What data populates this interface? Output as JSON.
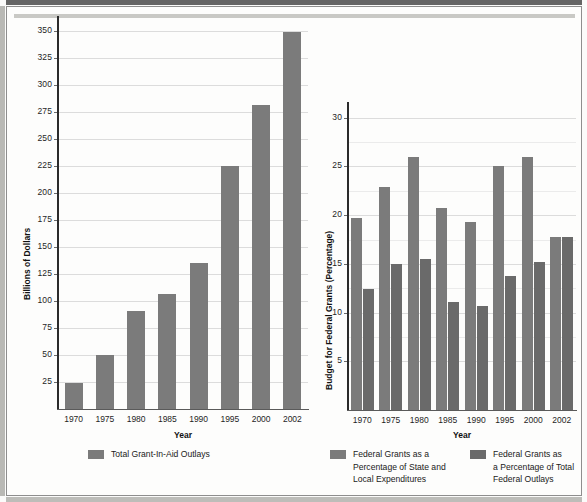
{
  "page": {
    "background_color": "#fdfdfc",
    "bar_color": "#7b7b7b",
    "bar_color_dark": "#6a6a6a"
  },
  "chart_data": [
    {
      "id": "left-chart",
      "type": "bar",
      "title": "",
      "xlabel": "Year",
      "ylabel": "Billions of Dollars",
      "categories": [
        "1970",
        "1975",
        "1980",
        "1985",
        "1990",
        "1995",
        "2000",
        "2002"
      ],
      "yticks": [
        25,
        50,
        75,
        100,
        125,
        150,
        175,
        200,
        225,
        250,
        275,
        300,
        325,
        350
      ],
      "ylim": [
        0,
        358
      ],
      "grid": true,
      "legend_position": "bottom",
      "series": [
        {
          "name": "Total Grant-In-Aid Outlays",
          "color": "#7b7b7b",
          "values": [
            24,
            50,
            91,
            106,
            135,
            225,
            281,
            349
          ]
        }
      ]
    },
    {
      "id": "right-chart",
      "type": "bar",
      "title": "",
      "xlabel": "Year",
      "ylabel": "Budget for Federal Grants (Percentage)",
      "categories": [
        "1970",
        "1975",
        "1980",
        "1985",
        "1990",
        "1995",
        "2000",
        "2002"
      ],
      "yticks": [
        5,
        10,
        15,
        20,
        25,
        30
      ],
      "yticks_minor": [
        7.5,
        12.5,
        17.5,
        22.5,
        27.5
      ],
      "ylim": [
        0,
        31
      ],
      "grid": true,
      "legend_position": "bottom",
      "series": [
        {
          "name": "Federal Grants as a\nPercentage of State and\nLocal Expenditures",
          "color": "#7b7b7b",
          "values": [
            19.7,
            22.9,
            26.0,
            20.7,
            19.3,
            25.0,
            26.0,
            17.8
          ]
        },
        {
          "name": "Federal Grants as\na Percentage of Total\nFederal Outlays",
          "color": "#6a6a6a",
          "values": [
            12.4,
            15.0,
            15.5,
            11.1,
            10.7,
            13.8,
            15.2,
            17.8
          ]
        }
      ]
    }
  ],
  "left": {
    "ylabel": "Billions of Dollars",
    "xlabel": "Year",
    "yticks": [
      "350",
      "325",
      "300",
      "275",
      "250",
      "225",
      "200",
      "175",
      "150",
      "125",
      "100",
      "75",
      "50",
      "25"
    ],
    "xticks": [
      "1970",
      "1975",
      "1980",
      "1985",
      "1990",
      "1995",
      "2000",
      "2002"
    ],
    "legend": [
      {
        "label": "Total Grant-In-Aid Outlays"
      }
    ]
  },
  "right": {
    "ylabel": "Budget for Federal Grants (Percentage)",
    "xlabel": "Year",
    "yticks": [
      "30",
      "25",
      "20",
      "15",
      "10",
      "5"
    ],
    "xticks": [
      "1970",
      "1975",
      "1980",
      "1985",
      "1990",
      "1995",
      "2000",
      "2002"
    ],
    "legend": [
      {
        "label": "Federal Grants as a\nPercentage of State and\nLocal Expenditures"
      },
      {
        "label": "Federal Grants as\na Percentage of Total\nFederal Outlays"
      }
    ]
  }
}
